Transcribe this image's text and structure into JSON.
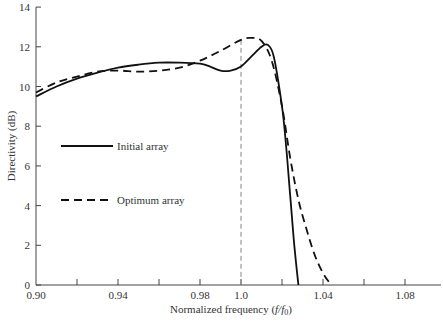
{
  "chart_data": {
    "type": "line",
    "title": "",
    "xlabel": "Normalized frequency (f/f0)",
    "ylabel": "Directivity (dB)",
    "xlim": [
      0.9,
      1.1
    ],
    "ylim": [
      0,
      14
    ],
    "x_ticks": [
      "0.90",
      "0.94",
      "0.98",
      "1.0",
      "1.04",
      "1.08"
    ],
    "x_minor_ticks": [
      0.92,
      0.96,
      1.02,
      1.06
    ],
    "y_ticks": [
      "0",
      "2",
      "4",
      "6",
      "8",
      "10",
      "12",
      "14"
    ],
    "grid": false,
    "reference_line": {
      "x": 1.0,
      "style": "dashed",
      "color": "#888888"
    },
    "legend": {
      "position": "center-left",
      "entries": [
        "Initial array",
        "Optimum array"
      ]
    },
    "series": [
      {
        "name": "Initial array",
        "style": "solid",
        "x": [
          0.9,
          0.91,
          0.92,
          0.93,
          0.94,
          0.95,
          0.96,
          0.97,
          0.98,
          0.985,
          0.99,
          0.995,
          1.0,
          1.005,
          1.01,
          1.013,
          1.016,
          1.02,
          1.022,
          1.024,
          1.026,
          1.028
        ],
        "values": [
          9.5,
          10.0,
          10.4,
          10.7,
          10.95,
          11.1,
          11.2,
          11.2,
          11.15,
          11.0,
          10.8,
          10.8,
          11.0,
          11.5,
          12.0,
          12.1,
          11.5,
          9.0,
          7.0,
          4.5,
          2.0,
          0.0
        ]
      },
      {
        "name": "Optimum array",
        "style": "dashed",
        "x": [
          0.9,
          0.91,
          0.92,
          0.93,
          0.94,
          0.95,
          0.96,
          0.97,
          0.98,
          0.99,
          1.0,
          1.005,
          1.01,
          1.015,
          1.02,
          1.024,
          1.028,
          1.032,
          1.036,
          1.04,
          1.044
        ],
        "values": [
          9.7,
          10.2,
          10.5,
          10.75,
          10.8,
          10.75,
          10.8,
          10.95,
          11.3,
          11.8,
          12.35,
          12.45,
          12.3,
          11.3,
          9.0,
          6.4,
          4.3,
          2.8,
          1.5,
          0.6,
          0.0
        ]
      }
    ]
  },
  "axes": {
    "x_label_main": "Normalized frequency (",
    "x_label_italic": "f/f",
    "x_label_sub": "0",
    "x_label_close": ")",
    "y_label": "Directivity (dB)"
  },
  "legend": {
    "initial_label": "Initial array",
    "optimum_label": "Optimum array"
  }
}
